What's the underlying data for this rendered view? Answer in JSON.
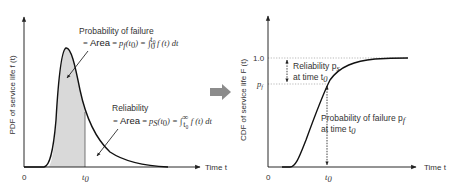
{
  "left_panel": {
    "y_axis_label": "PDF of service life f (t)",
    "x_axis_label": "Time t",
    "origin_label": "0",
    "t0_label": "t",
    "t0_sub": "0",
    "failure_annotation": {
      "title": "Probability of failure",
      "eq_prefix": "= ",
      "eq_area": "Area",
      "eq_rest": " = p",
      "eq_sub": "f",
      "eq_tail": "(t₀) = ∫₀ᵗ⁰ f (t) dt"
    },
    "reliability_annotation": {
      "title": "Reliability",
      "eq_prefix": "= ",
      "eq_area": "Area",
      "eq_rest": " = p",
      "eq_sub": "S",
      "eq_tail": "(t₀) = ∫ₜ₀^∞ f (t) dt"
    },
    "shaded_color": "#d9d9d9"
  },
  "arrow": {
    "color": "#8c8c8c",
    "meaning": "transform-arrow"
  },
  "right_panel": {
    "y_axis_label": "CDF of service life F (t)",
    "x_axis_label": "Time t",
    "origin_label": "0",
    "t0_label": "t",
    "t0_sub": "0",
    "y_tick_top": "1.0",
    "y_tick_pf": "p",
    "y_tick_pf_sub": "f",
    "reliability_note_line1": "Reliability p",
    "reliability_note_line1_sub": "s",
    "reliability_note_line2": "at time t",
    "reliability_note_line2_sub": "0",
    "failure_note_line1": "Probability of failure p",
    "failure_note_line1_sub": "f",
    "failure_note_line2": "at time t",
    "failure_note_line2_sub": "0"
  }
}
